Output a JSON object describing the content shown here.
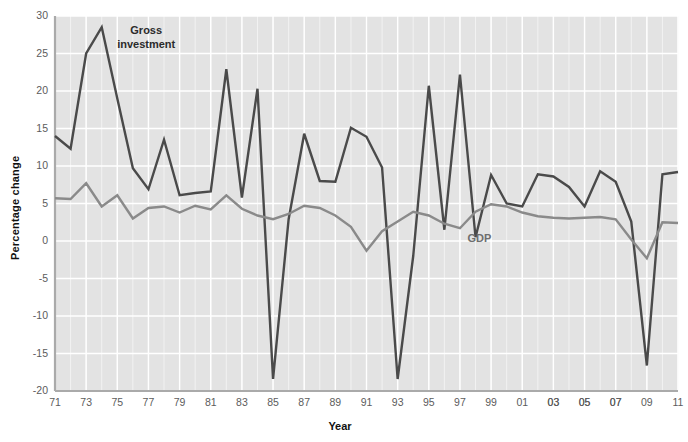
{
  "chart_data": {
    "type": "line",
    "title": "",
    "xlabel": "Year",
    "ylabel": "Percentage change",
    "ylim": [
      -20,
      30
    ],
    "yticks": [
      30,
      25,
      20,
      15,
      10,
      5,
      0,
      -5,
      -10,
      -15,
      -20
    ],
    "grid": true,
    "legend_position": "inline-annotation",
    "x": [
      1971,
      1972,
      1973,
      1974,
      1975,
      1976,
      1977,
      1978,
      1979,
      1980,
      1981,
      1982,
      1983,
      1984,
      1985,
      1986,
      1987,
      1988,
      1989,
      1990,
      1991,
      1992,
      1993,
      1994,
      1995,
      1996,
      1997,
      1998,
      1999,
      2000,
      2001,
      2002,
      2003,
      2004,
      2005,
      2006,
      2007,
      2008,
      2009,
      2010,
      2011
    ],
    "xticklabels": [
      "71",
      "73",
      "75",
      "77",
      "79",
      "81",
      "83",
      "85",
      "87",
      "89",
      "91",
      "93",
      "95",
      "97",
      "99",
      "01",
      "03",
      "05",
      "07",
      "03",
      "05",
      "07",
      "09",
      "11"
    ],
    "xtick_indices": [
      0,
      2,
      4,
      6,
      8,
      10,
      12,
      14,
      16,
      18,
      20,
      22,
      24,
      26,
      28,
      30,
      32,
      34,
      36,
      32,
      34,
      36,
      38,
      40
    ],
    "series": [
      {
        "name": "Gross investment",
        "color": "#4a4a4a",
        "label_x_pct": 21.5,
        "label_y_pct": 5.5,
        "values": [
          14.0,
          12.3,
          25.0,
          28.5,
          19.0,
          9.7,
          6.9,
          13.5,
          6.1,
          6.4,
          6.6,
          22.9,
          5.8,
          20.3,
          -18.4,
          2.9,
          14.3,
          8.0,
          7.9,
          15.1,
          13.9,
          9.8,
          -18.4,
          -2.0,
          20.7,
          1.5,
          22.2,
          0.5,
          8.8,
          5.0,
          4.6,
          8.9,
          8.6,
          7.2,
          4.6,
          9.3,
          7.9,
          2.6,
          -16.6,
          8.9,
          9.2
        ]
      },
      {
        "name": "GDP",
        "color": "#8a8a8a",
        "label_x_pct": 70.5,
        "label_y_pct": 52.5,
        "values": [
          5.7,
          5.6,
          7.7,
          4.6,
          6.1,
          3.0,
          4.4,
          4.6,
          3.8,
          4.7,
          4.2,
          6.1,
          4.3,
          3.4,
          2.9,
          3.6,
          4.7,
          4.4,
          3.4,
          1.9,
          -1.3,
          1.3,
          2.6,
          3.9,
          3.4,
          2.3,
          1.7,
          3.9,
          4.9,
          4.6,
          3.8,
          3.3,
          3.1,
          3.0,
          3.1,
          3.2,
          2.9,
          0.2,
          -2.3,
          2.5,
          2.4
        ]
      }
    ]
  },
  "axis": {
    "y_title": "Percentage change",
    "x_title": "Year"
  }
}
